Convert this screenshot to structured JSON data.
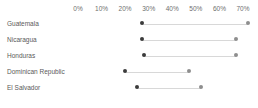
{
  "chart_data": {
    "type": "bar",
    "subtype": "dumbbell-range",
    "title": "",
    "subtitle": "",
    "xlabel": "",
    "ylabel": "",
    "xlim": [
      0,
      70
    ],
    "grid": false,
    "legend": null,
    "axis_position": "top",
    "x_ticks": [
      "0%",
      "10%",
      "20%",
      "30%",
      "40%",
      "50%",
      "60%",
      "70%"
    ],
    "x_tick_values": [
      0,
      10,
      20,
      30,
      40,
      50,
      60,
      70
    ],
    "categories": [
      "Guatemala",
      "Nicaragua",
      "Honduras",
      "Dominican Republic",
      "El Salvador"
    ],
    "series": [
      {
        "name": "start",
        "values": [
          27,
          27,
          28,
          20,
          25
        ],
        "color": "#3b3b3b"
      },
      {
        "name": "end",
        "values": [
          72,
          67,
          67,
          47,
          52
        ],
        "color": "#8e8e8e"
      }
    ],
    "rows": [
      {
        "label": "Guatemala",
        "start": 27,
        "end": 72
      },
      {
        "label": "Nicaragua",
        "start": 27,
        "end": 67
      },
      {
        "label": "Honduras",
        "start": 28,
        "end": 67
      },
      {
        "label": "Dominican Republic",
        "start": 20,
        "end": 47
      },
      {
        "label": "El Salvador",
        "start": 25,
        "end": 52
      }
    ],
    "colors": {
      "background": "#ffffff",
      "label_text": "#5a5a5a",
      "tick_text": "#6e6e6e",
      "connector": "#d8d8d8",
      "dot_start": "#3b3b3b",
      "dot_end": "#8e8e8e"
    },
    "scale": {
      "x_at_zero_px": 78,
      "px_per_percent": 2.357
    }
  }
}
